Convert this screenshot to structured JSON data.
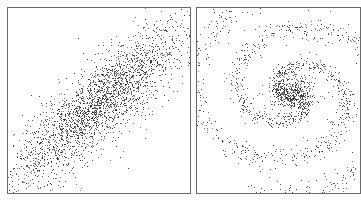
{
  "chart_data": [
    {
      "type": "scatter",
      "title": "",
      "xlabel": "",
      "ylabel": "",
      "grid": false,
      "legend": null,
      "description": "Elongated elliptical Gaussian point cloud oriented diagonally from lower-left to upper-right",
      "distribution": {
        "kind": "rotated_gaussian",
        "n_points": 2600,
        "center": [
          0.5,
          0.48
        ],
        "angle_deg": 42,
        "sigma_major": 0.32,
        "sigma_minor": 0.09
      },
      "point_color": "#2a2a2a"
    },
    {
      "type": "scatter",
      "title": "",
      "xlabel": "",
      "ylabel": "",
      "grid": false,
      "legend": null,
      "description": "Spiral galaxy-like point cloud with dense core and two curved arms",
      "distribution": {
        "kind": "spiral",
        "n_points": 2000,
        "center": [
          0.58,
          0.46
        ],
        "arms": 2,
        "core_fraction": 0.25,
        "core_sigma": 0.06,
        "winding": 2.6,
        "arm_spread": 0.05,
        "max_radius": 0.62
      },
      "point_color": "#2a2a2a"
    }
  ],
  "panels": {
    "left": {
      "border_color": "#6a6a6a"
    },
    "right": {
      "border_color": "#6a6a6a"
    }
  }
}
